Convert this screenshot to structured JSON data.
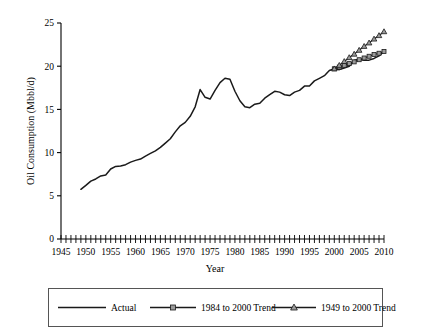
{
  "chart_data": {
    "type": "line",
    "title": "",
    "xlabel": "Year",
    "ylabel": "Oil Consumption (Mbbl/d)",
    "xlim": [
      1945,
      2010
    ],
    "ylim": [
      0,
      25
    ],
    "xticks": [
      1945,
      1950,
      1955,
      1960,
      1965,
      1970,
      1975,
      1980,
      1985,
      1990,
      1995,
      2000,
      2005,
      2010
    ],
    "xtick_labels": [
      "1945",
      "1950",
      "1955",
      "1960",
      "1965",
      "1970",
      "1975",
      "1980",
      "1985",
      "1990",
      "1995",
      "2000",
      "2005",
      "2010"
    ],
    "xtick_minor_step": 1,
    "yticks": [
      0,
      5,
      10,
      15,
      20,
      25
    ],
    "ytick_labels": [
      "0",
      "5",
      "10",
      "15",
      "20",
      "25"
    ],
    "grid": false,
    "legend_position": "below",
    "series": [
      {
        "name": "Actual",
        "marker": "none",
        "color": "#1a1a1a",
        "x": [
          1949,
          1950,
          1951,
          1952,
          1953,
          1954,
          1955,
          1956,
          1957,
          1958,
          1959,
          1960,
          1961,
          1962,
          1963,
          1964,
          1965,
          1966,
          1967,
          1968,
          1969,
          1970,
          1971,
          1972,
          1973,
          1974,
          1975,
          1976,
          1977,
          1978,
          1979,
          1980,
          1981,
          1982,
          1983,
          1984,
          1985,
          1986,
          1987,
          1988,
          1989,
          1990,
          1991,
          1992,
          1993,
          1994,
          1995,
          1996,
          1997,
          1998,
          1999,
          2000,
          2001,
          2002,
          2003,
          2004,
          2005,
          2006,
          2007,
          2008,
          2009,
          2010
        ],
        "y": [
          5.75,
          6.2,
          6.7,
          6.95,
          7.3,
          7.4,
          8.1,
          8.4,
          8.45,
          8.6,
          8.9,
          9.1,
          9.25,
          9.6,
          9.9,
          10.2,
          10.6,
          11.1,
          11.6,
          12.4,
          13.1,
          13.5,
          14.2,
          15.3,
          17.3,
          16.4,
          16.2,
          17.2,
          18.1,
          18.6,
          18.5,
          17.1,
          16.0,
          15.3,
          15.2,
          15.6,
          15.7,
          16.3,
          16.7,
          17.1,
          17.0,
          16.7,
          16.6,
          17.0,
          17.2,
          17.7,
          17.7,
          18.3,
          18.6,
          18.9,
          19.5,
          19.7,
          19.6,
          19.8,
          20.0,
          20.7,
          20.8,
          20.7,
          20.7,
          20.9,
          21.2,
          21.7
        ]
      },
      {
        "name": "1984 to 2000 Trend",
        "marker": "square",
        "color": "#1a1a1a",
        "x": [
          2000,
          2001,
          2002,
          2003,
          2004,
          2005,
          2006,
          2007,
          2008,
          2009,
          2010
        ],
        "y": [
          19.7,
          19.9,
          20.1,
          20.3,
          20.5,
          20.75,
          20.95,
          21.15,
          21.35,
          21.5,
          21.7
        ]
      },
      {
        "name": "1949 to 2000 Trend",
        "marker": "triangle",
        "color": "#1a1a1a",
        "x": [
          2000,
          2001,
          2002,
          2003,
          2004,
          2005,
          2006,
          2007,
          2008,
          2009,
          2010
        ],
        "y": [
          19.7,
          20.1,
          20.55,
          21.0,
          21.4,
          21.85,
          22.3,
          22.7,
          23.15,
          23.55,
          24.0
        ]
      }
    ]
  },
  "legend": {
    "items": [
      {
        "label": "Actual",
        "marker": "none"
      },
      {
        "label": "1984 to 2000 Trend",
        "marker": "square"
      },
      {
        "label": "1949 to 2000 Trend",
        "marker": "triangle"
      }
    ]
  },
  "colors": {
    "line": "#1a1a1a",
    "axis": "#000000",
    "legend_border": "#555555",
    "background": "#ffffff"
  }
}
